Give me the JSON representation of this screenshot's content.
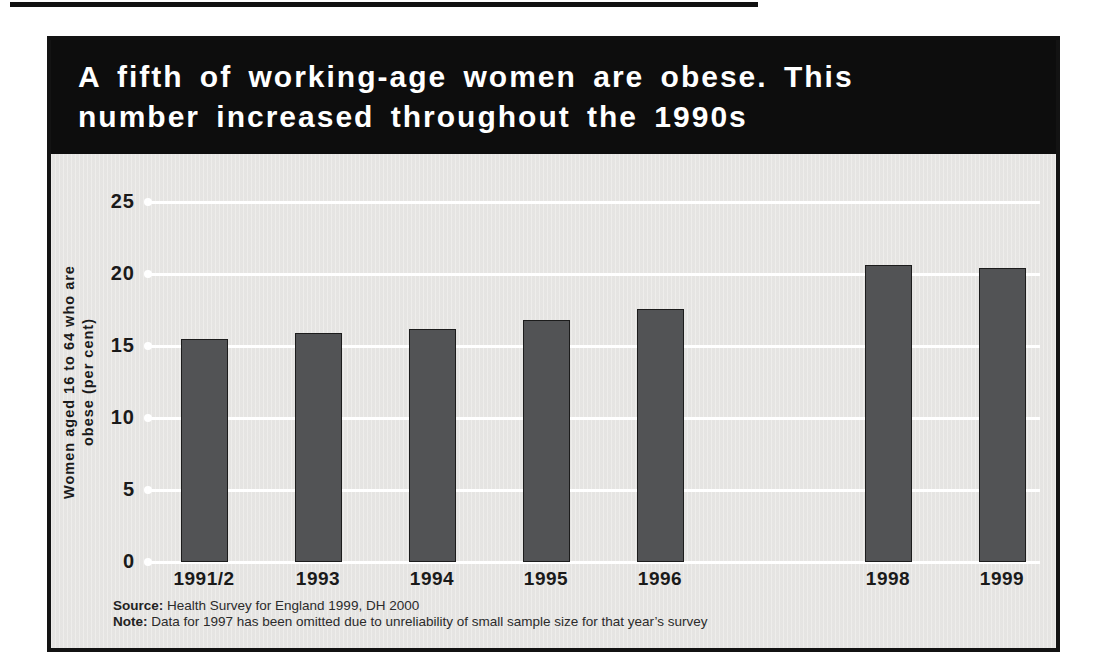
{
  "banner": {
    "title_line1": "A fifth of working-age women are obese. This",
    "title_line2": "number increased throughout the 1990s",
    "bg": "#0d0d0d",
    "fg": "#ffffff"
  },
  "chart_data": {
    "type": "bar",
    "title": "A fifth of working-age women are obese. This number increased throughout the 1990s",
    "categories": [
      "1991/2",
      "1993",
      "1994",
      "1995",
      "1996",
      "1998",
      "1999"
    ],
    "values": [
      15.5,
      15.9,
      16.2,
      16.8,
      17.6,
      20.6,
      20.4
    ],
    "omitted_category": "1997",
    "gap_after_category": "1996",
    "xlabel": "",
    "ylabel": "Women aged 16 to 64 who are obese (per cent)",
    "ylabel_lines": [
      "Women aged 16 to 64 who are",
      "obese (per cent)"
    ],
    "yticks": [
      0,
      5,
      10,
      15,
      20,
      25
    ],
    "ylim": [
      0,
      25
    ],
    "grid": "horizontal",
    "legend": "none",
    "bar_color": "#525355",
    "grid_color": "#ffffff",
    "plot_bg": "#e9e8e6"
  },
  "footnotes": {
    "source_label": "Source:",
    "source_text": " Health Survey for England 1999, DH 2000",
    "note_label": "Note:",
    "note_text": " Data for 1997 has been omitted due to unreliability of small sample size for that year’s survey"
  }
}
